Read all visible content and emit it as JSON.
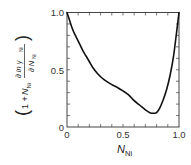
{
  "chart_data": {
    "type": "line",
    "title": "",
    "xlabel": "N_Ni",
    "xlabel_main": "N",
    "xlabel_sub": "Ni",
    "ylabel": "(1 + N_Ni ∂ln γ_Ni / ∂N_Ni)",
    "ylabel_parts": {
      "open_paren": "(",
      "one_plus": "1 + ",
      "N": "N",
      "N_sub": "Ni",
      "numerator": "∂ ln γ",
      "numerator_sub": "Ni",
      "denominator": "∂ N",
      "denominator_sub": "Ni",
      "close_paren": ")"
    },
    "xlim": [
      0,
      1.0
    ],
    "ylim": [
      0,
      1.0
    ],
    "x_ticks": [
      0,
      0.5,
      1.0
    ],
    "x_tick_labels": [
      "0",
      "0.5",
      "1.0"
    ],
    "y_ticks": [
      0,
      0.5,
      1.0
    ],
    "y_tick_labels": [
      "0",
      "0.5",
      "1.0"
    ],
    "minor_tick_step": 0.1,
    "grid": false,
    "legend": null,
    "series": [
      {
        "name": "curve",
        "x": [
          0,
          0.02,
          0.04,
          0.06,
          0.08,
          0.1,
          0.12,
          0.14,
          0.17,
          0.2,
          0.23,
          0.27,
          0.31,
          0.35,
          0.4,
          0.45,
          0.5,
          0.55,
          0.6,
          0.65,
          0.7,
          0.74,
          0.77,
          0.8,
          0.83,
          0.86,
          0.89,
          0.92,
          0.95,
          0.975,
          1.0
        ],
        "y": [
          1.0,
          0.94,
          0.88,
          0.83,
          0.79,
          0.75,
          0.71,
          0.67,
          0.62,
          0.57,
          0.52,
          0.47,
          0.43,
          0.4,
          0.37,
          0.345,
          0.315,
          0.28,
          0.23,
          0.19,
          0.15,
          0.125,
          0.12,
          0.125,
          0.17,
          0.24,
          0.33,
          0.45,
          0.61,
          0.8,
          1.0
        ]
      }
    ]
  }
}
